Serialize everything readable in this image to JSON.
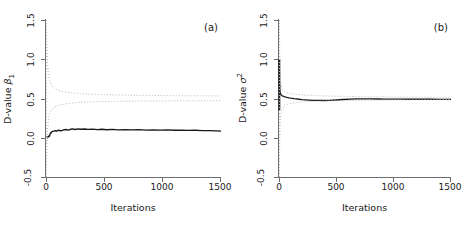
{
  "figure": {
    "width": 461,
    "height": 230,
    "background": "#ffffff",
    "ink_color": "#1a1a1a",
    "axis_color": "#6e6e6e",
    "band_color": "#bdbdbd",
    "line_color": "#1a1a1a"
  },
  "panels": [
    {
      "tag": "(a)",
      "ylabel_prefix": "D-value ",
      "ylabel_symbol": "β",
      "ylabel_sub": "1",
      "ylabel_sup": "",
      "xlabel": "Iterations",
      "yticks": [
        "-0.5",
        "0.0",
        "0.5",
        "1.0",
        "1.5"
      ],
      "xticks": [
        "0",
        "500",
        "1000",
        "1500"
      ]
    },
    {
      "tag": "(b)",
      "ylabel_prefix": "D-value ",
      "ylabel_symbol": "σ",
      "ylabel_sub": "",
      "ylabel_sup": "2",
      "xlabel": "Iterations",
      "yticks": [
        "-0.5",
        "0.0",
        "0.5",
        "1.0",
        "1.5"
      ],
      "xticks": [
        "0",
        "500",
        "1000",
        "1500"
      ]
    }
  ],
  "chart_data": [
    {
      "type": "line",
      "title": "(a)",
      "xlabel": "Iterations",
      "ylabel": "D-value β₁",
      "xlim": [
        0,
        1500
      ],
      "ylim": [
        -0.5,
        1.5
      ],
      "xticks": [
        0,
        500,
        1000,
        1500
      ],
      "yticks": [
        -0.5,
        0.0,
        0.5,
        1.0,
        1.5
      ],
      "grid": false,
      "legend": "none",
      "series": [
        {
          "name": "D-value (running statistic)",
          "style": "solid",
          "color": "#1a1a1a",
          "x": [
            2,
            5,
            8,
            11,
            14,
            18,
            22,
            26,
            30,
            34,
            38,
            42,
            46,
            50,
            56,
            62,
            70,
            80,
            90,
            100,
            115,
            130,
            150,
            170,
            190,
            210,
            230,
            250,
            275,
            300,
            330,
            360,
            400,
            440,
            480,
            520,
            570,
            620,
            680,
            740,
            800,
            860,
            920,
            980,
            1040,
            1100,
            1160,
            1220,
            1280,
            1340,
            1400,
            1460,
            1500
          ],
          "y": [
            0.0,
            0.005,
            0.01,
            0.005,
            0.0,
            0.01,
            0.02,
            0.015,
            0.02,
            0.045,
            0.06,
            0.055,
            0.07,
            0.075,
            0.08,
            0.085,
            0.085,
            0.09,
            0.082,
            0.092,
            0.095,
            0.088,
            0.1,
            0.105,
            0.098,
            0.108,
            0.112,
            0.105,
            0.112,
            0.108,
            0.112,
            0.106,
            0.11,
            0.104,
            0.108,
            0.102,
            0.106,
            0.1,
            0.104,
            0.1,
            0.103,
            0.098,
            0.101,
            0.097,
            0.1,
            0.096,
            0.098,
            0.094,
            0.095,
            0.091,
            0.09,
            0.087,
            0.085
          ]
        },
        {
          "name": "Upper reference band",
          "style": "dotted",
          "color": "#bdbdbd",
          "x": [
            3,
            5,
            8,
            12,
            16,
            20,
            26,
            32,
            40,
            50,
            62,
            76,
            92,
            110,
            130,
            155,
            185,
            220,
            260,
            310,
            370,
            440,
            520,
            610,
            710,
            820,
            940,
            1070,
            1210,
            1360,
            1500
          ],
          "y": [
            1.5,
            1.34,
            1.16,
            1.0,
            0.9,
            0.83,
            0.77,
            0.73,
            0.695,
            0.665,
            0.645,
            0.628,
            0.614,
            0.602,
            0.594,
            0.586,
            0.578,
            0.572,
            0.566,
            0.56,
            0.556,
            0.552,
            0.548,
            0.545,
            0.542,
            0.54,
            0.538,
            0.536,
            0.535,
            0.534,
            0.533
          ]
        },
        {
          "name": "Lower reference band",
          "style": "dotted",
          "color": "#bdbdbd",
          "x": [
            3,
            5,
            8,
            12,
            16,
            20,
            26,
            32,
            40,
            50,
            62,
            76,
            92,
            110,
            130,
            155,
            185,
            220,
            260,
            310,
            370,
            440,
            520,
            610,
            710,
            820,
            940,
            1070,
            1210,
            1360,
            1500
          ],
          "y": [
            -0.5,
            -0.28,
            -0.08,
            0.08,
            0.16,
            0.22,
            0.27,
            0.305,
            0.335,
            0.358,
            0.376,
            0.39,
            0.402,
            0.412,
            0.42,
            0.428,
            0.435,
            0.441,
            0.447,
            0.452,
            0.456,
            0.459,
            0.462,
            0.464,
            0.466,
            0.467,
            0.468,
            0.469,
            0.47,
            0.471,
            0.472
          ]
        },
        {
          "name": "Initial vertical reference",
          "style": "dotted-vertical",
          "color": "#bdbdbd",
          "x": [
            3,
            3
          ],
          "y": [
            -0.5,
            1.5
          ]
        }
      ]
    },
    {
      "type": "line",
      "title": "(b)",
      "xlabel": "Iterations",
      "ylabel": "D-value σ²",
      "xlim": [
        0,
        1500
      ],
      "ylim": [
        -0.5,
        1.5
      ],
      "xticks": [
        0,
        500,
        1000,
        1500
      ],
      "yticks": [
        -0.5,
        0.0,
        0.5,
        1.0,
        1.5
      ],
      "grid": false,
      "legend": "none",
      "series": [
        {
          "name": "D-value (running statistic)",
          "style": "solid",
          "color": "#1a1a1a",
          "x": [
            2,
            3,
            4,
            5,
            6,
            8,
            10,
            12,
            15,
            18,
            22,
            26,
            30,
            35,
            40,
            46,
            52,
            60,
            68,
            78,
            88,
            100,
            115,
            130,
            150,
            175,
            200,
            230,
            260,
            300,
            340,
            390,
            440,
            500,
            560,
            620,
            680,
            740,
            800,
            860,
            920,
            980,
            1050,
            1120,
            1190,
            1260,
            1330,
            1400,
            1460,
            1500
          ],
          "y": [
            1.0,
            0.86,
            0.74,
            0.66,
            0.62,
            0.59,
            0.575,
            0.565,
            0.556,
            0.549,
            0.543,
            0.538,
            0.534,
            0.53,
            0.527,
            0.523,
            0.52,
            0.517,
            0.514,
            0.511,
            0.508,
            0.505,
            0.502,
            0.498,
            0.495,
            0.49,
            0.486,
            0.483,
            0.48,
            0.477,
            0.476,
            0.475,
            0.477,
            0.481,
            0.487,
            0.492,
            0.495,
            0.496,
            0.495,
            0.494,
            0.493,
            0.492,
            0.492,
            0.491,
            0.491,
            0.49,
            0.49,
            0.489,
            0.489,
            0.488
          ]
        },
        {
          "name": "Initial spike (burn-in spread)",
          "style": "vertical-band",
          "color": "#1a1a1a",
          "x": [
            3,
            3
          ],
          "y": [
            0.35,
            1.0
          ]
        },
        {
          "name": "Upper reference band",
          "style": "dotted",
          "color": "#bdbdbd",
          "x": [
            4,
            6,
            9,
            13,
            18,
            24,
            32,
            42,
            55,
            70,
            90,
            115,
            145,
            180,
            225,
            280,
            350,
            430,
            530,
            650,
            790,
            950,
            1120,
            1300,
            1500
          ],
          "y": [
            1.5,
            1.1,
            0.86,
            0.74,
            0.675,
            0.64,
            0.615,
            0.598,
            0.584,
            0.574,
            0.566,
            0.559,
            0.553,
            0.548,
            0.543,
            0.539,
            0.535,
            0.531,
            0.528,
            0.525,
            0.522,
            0.519,
            0.517,
            0.515,
            0.513
          ]
        },
        {
          "name": "Lower reference band",
          "style": "dotted",
          "color": "#bdbdbd",
          "x": [
            4,
            6,
            9,
            13,
            18,
            24,
            32,
            42,
            55,
            70,
            90,
            115,
            145,
            180,
            225,
            280,
            350,
            430,
            530,
            650,
            790,
            950,
            1120,
            1300,
            1500
          ],
          "y": [
            -0.5,
            -0.1,
            0.14,
            0.26,
            0.325,
            0.36,
            0.385,
            0.402,
            0.416,
            0.426,
            0.434,
            0.441,
            0.447,
            0.452,
            0.457,
            0.461,
            0.465,
            0.469,
            0.472,
            0.475,
            0.478,
            0.481,
            0.483,
            0.485,
            0.487
          ]
        },
        {
          "name": "Initial vertical reference",
          "style": "dotted-vertical",
          "color": "#bdbdbd",
          "x": [
            4,
            4
          ],
          "y": [
            -0.5,
            1.5
          ]
        }
      ]
    }
  ]
}
